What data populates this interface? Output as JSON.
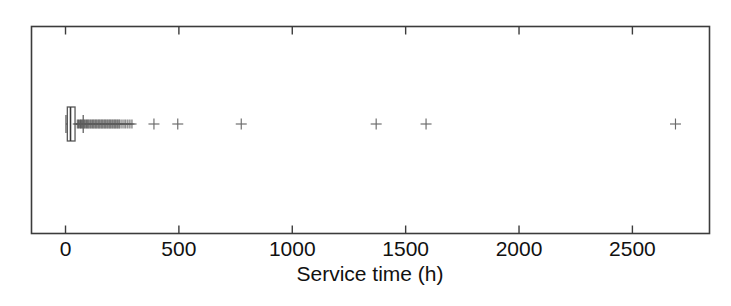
{
  "chart_data": {
    "type": "box",
    "title": "",
    "xlabel": "Service time (h)",
    "ylabel": "",
    "xlim": [
      -150,
      2840
    ],
    "xticks": [
      0,
      500,
      1000,
      1500,
      2000,
      2500
    ],
    "xticklabels": [
      "0",
      "500",
      "1000",
      "1500",
      "2000",
      "2500"
    ],
    "grid": false,
    "legend": null,
    "orientation": "horizontal",
    "box": {
      "whisker_low": 2,
      "q1": 8,
      "median": 22,
      "q3": 42,
      "whisker_high": 78
    },
    "outliers": [
      52,
      57,
      61,
      66,
      70,
      74,
      78,
      83,
      87,
      92,
      96,
      100,
      104,
      109,
      113,
      118,
      122,
      126,
      131,
      135,
      139,
      144,
      148,
      152,
      157,
      161,
      165,
      170,
      174,
      178,
      183,
      187,
      192,
      196,
      200,
      205,
      209,
      214,
      218,
      222,
      227,
      231,
      236,
      240,
      249,
      258,
      266,
      275,
      284,
      293,
      390,
      495,
      775,
      1370,
      1590,
      2690
    ],
    "outlier_count": 56,
    "marker": "+"
  },
  "axis": {
    "tick_labels": [
      "0",
      "500",
      "1000",
      "1500",
      "2000",
      "2500"
    ],
    "title": "Service time (h)"
  },
  "colors": {
    "frame": "#3c3c3c",
    "marker": "#6a6a6a",
    "box_stroke": "#585858",
    "background": "#ffffff",
    "text": "#111111"
  }
}
